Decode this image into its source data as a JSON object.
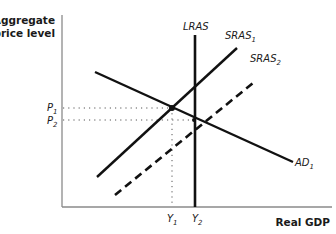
{
  "diagram": {
    "y_axis": {
      "label_line1": "Aggregate",
      "label_line2": "price level"
    },
    "x_axis": {
      "label": "Real GDP"
    },
    "curves": {
      "lras": {
        "label": "LRAS"
      },
      "sras1": {
        "label": "SRAS",
        "sub": "1"
      },
      "sras2": {
        "label": "SRAS",
        "sub": "2"
      },
      "ad1": {
        "label": "AD",
        "sub": "1"
      }
    },
    "price_ticks": {
      "p1": {
        "label": "P",
        "sub": "1"
      },
      "p2": {
        "label": "P",
        "sub": "2"
      }
    },
    "output_ticks": {
      "y1": {
        "label": "Y",
        "sub": "1"
      },
      "y2": {
        "label": "Y",
        "sub": "2"
      }
    },
    "colors": {
      "line": "#111111",
      "axis": "#8a8a8a",
      "guide": "#555555"
    }
  }
}
